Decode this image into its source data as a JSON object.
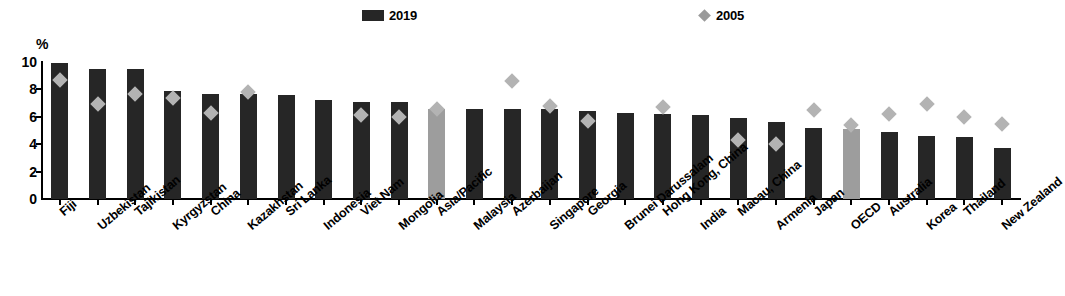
{
  "legend": {
    "entries": [
      {
        "label": "2019",
        "type": "bar",
        "color": "#262626"
      },
      {
        "label": "2005",
        "type": "diamond",
        "color": "#9a9a9a"
      }
    ]
  },
  "axis": {
    "unit_label": "%",
    "y_ticks": [
      "0",
      "2",
      "4",
      "6",
      "8",
      "10"
    ]
  },
  "chart_data": {
    "type": "bar",
    "title": "",
    "xlabel": "",
    "ylabel": "%",
    "ylim": [
      0,
      10
    ],
    "yticks": [
      0,
      2,
      4,
      6,
      8,
      10
    ],
    "grid": false,
    "legend_position": "top-center",
    "categories": [
      "Fiji",
      "Uzbekistan",
      "Tajikistan",
      "Kyrgyzstan",
      "China",
      "Kazakhstan",
      "Sri Lanka",
      "Indonesia",
      "Viet Nam",
      "Mongolia",
      "Asia/Pacific",
      "Malaysia",
      "Azerbaijan",
      "Singapore",
      "Georgia",
      "Brunei Darussalam",
      "Hong Kong, China",
      "India",
      "Macau, China",
      "Armenia",
      "Japan",
      "OECD",
      "Australia",
      "Korea",
      "Thailand",
      "New Zealand"
    ],
    "highlighted_categories": [
      "Asia/Pacific",
      "OECD"
    ],
    "series": [
      {
        "name": "2019",
        "type": "bar",
        "color": "#262626",
        "highlight_color": "#9d9d9d",
        "values": [
          9.9,
          9.5,
          9.5,
          7.9,
          7.7,
          7.7,
          7.6,
          7.2,
          7.1,
          7.1,
          6.6,
          6.6,
          6.6,
          6.6,
          6.4,
          6.3,
          6.2,
          6.1,
          5.9,
          5.6,
          5.2,
          5.1,
          4.9,
          4.6,
          4.5,
          3.7
        ]
      },
      {
        "name": "2005",
        "type": "diamond",
        "color": "#b3b3b3",
        "values": [
          8.7,
          6.9,
          7.7,
          7.4,
          6.3,
          7.8,
          null,
          null,
          6.1,
          6.0,
          6.6,
          null,
          8.6,
          6.8,
          5.7,
          null,
          6.7,
          null,
          4.3,
          4.0,
          6.5,
          5.4,
          6.2,
          6.9,
          6.0,
          5.5
        ]
      }
    ]
  }
}
